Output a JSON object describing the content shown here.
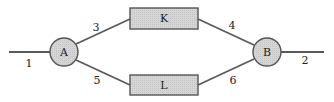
{
  "diagram": {
    "type": "network",
    "colors": {
      "node_fill": "#d2d2d2",
      "stroke": "#555555",
      "text": "#222222"
    },
    "nodes": [
      {
        "id": "A",
        "label": "A",
        "shape": "circle"
      },
      {
        "id": "B",
        "label": "B",
        "shape": "circle"
      },
      {
        "id": "K",
        "label": "K",
        "shape": "rectangle"
      },
      {
        "id": "L",
        "label": "L",
        "shape": "rectangle"
      }
    ],
    "edges": [
      {
        "label": "1",
        "from": "input",
        "to": "A"
      },
      {
        "label": "3",
        "from": "A",
        "to": "K"
      },
      {
        "label": "5",
        "from": "A",
        "to": "L"
      },
      {
        "label": "4",
        "from": "K",
        "to": "B"
      },
      {
        "label": "6",
        "from": "L",
        "to": "B"
      },
      {
        "label": "2",
        "from": "B",
        "to": "output"
      }
    ]
  }
}
